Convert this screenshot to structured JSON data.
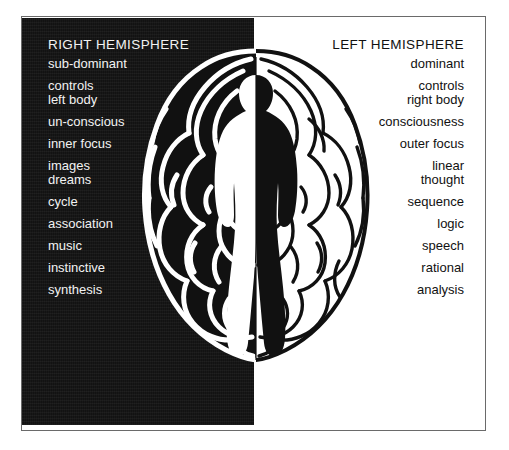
{
  "figure": {
    "illustration_name": "split-brain-with-human-figure",
    "colors": {
      "dark_panel": "#121212",
      "light_panel": "#ffffff",
      "dark_text": "#f2f2f2",
      "light_text": "#111111",
      "frame_line": "#6a6a6a"
    }
  },
  "right_hemisphere": {
    "heading": "RIGHT HEMISPHERE",
    "terms": [
      {
        "label": "sub-dominant",
        "spacing": "gap-0"
      },
      {
        "label": "controls",
        "spacing": "gap-1"
      },
      {
        "label": "left body",
        "spacing": "gap-0"
      },
      {
        "label": "un-conscious",
        "spacing": "gap-1"
      },
      {
        "label": "inner focus",
        "spacing": "gap-1"
      },
      {
        "label": "images",
        "spacing": "gap-1"
      },
      {
        "label": "dreams",
        "spacing": "gap-0"
      },
      {
        "label": "cycle",
        "spacing": "gap-1"
      },
      {
        "label": "association",
        "spacing": "gap-1"
      },
      {
        "label": "music",
        "spacing": "gap-1"
      },
      {
        "label": "instinctive",
        "spacing": "gap-1"
      },
      {
        "label": "synthesis",
        "spacing": "gap-1"
      }
    ]
  },
  "left_hemisphere": {
    "heading": "LEFT HEMISPHERE",
    "terms": [
      {
        "label": "dominant",
        "spacing": "gap-0"
      },
      {
        "label": "controls",
        "spacing": "gap-1"
      },
      {
        "label": "right body",
        "spacing": "gap-0"
      },
      {
        "label": "consciousness",
        "spacing": "gap-1"
      },
      {
        "label": "outer focus",
        "spacing": "gap-1"
      },
      {
        "label": "linear",
        "spacing": "gap-1"
      },
      {
        "label": "thought",
        "spacing": "gap-0"
      },
      {
        "label": "sequence",
        "spacing": "gap-1"
      },
      {
        "label": "logic",
        "spacing": "gap-1"
      },
      {
        "label": "speech",
        "spacing": "gap-1"
      },
      {
        "label": "rational",
        "spacing": "gap-1"
      },
      {
        "label": "analysis",
        "spacing": "gap-1"
      }
    ]
  }
}
